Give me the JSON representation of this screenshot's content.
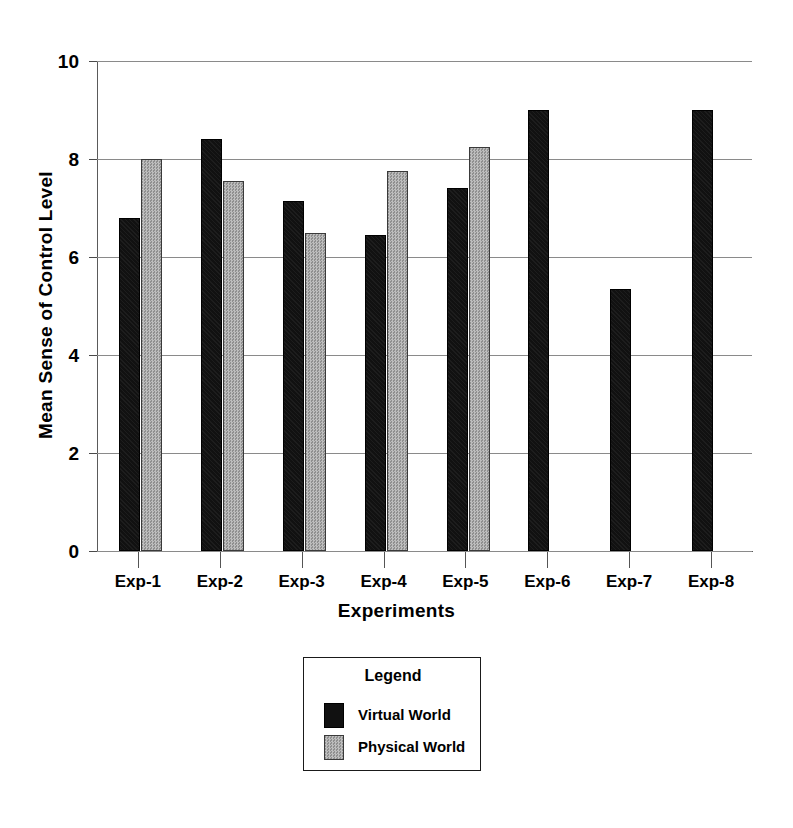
{
  "chart_data": {
    "type": "bar",
    "title": "",
    "xlabel": "Experiments",
    "ylabel": "Mean Sense of Control Level",
    "categories": [
      "Exp-1",
      "Exp-2",
      "Exp-3",
      "Exp-4",
      "Exp-5",
      "Exp-6",
      "Exp-7",
      "Exp-8"
    ],
    "series": [
      {
        "name": "Virtual World",
        "color": "#111111",
        "values": [
          6.8,
          8.4,
          7.15,
          6.45,
          7.4,
          9.0,
          5.35,
          9.0
        ]
      },
      {
        "name": "Physical World",
        "color": "#a8a8a8",
        "values": [
          8.0,
          7.55,
          6.5,
          7.75,
          8.25,
          null,
          null,
          null
        ]
      }
    ],
    "ylim": [
      0,
      10
    ],
    "yticks": [
      0,
      2,
      4,
      6,
      8,
      10
    ],
    "ytick_labels": [
      "0",
      "2",
      "4",
      "6",
      "8",
      "10"
    ],
    "grid": "horizontal",
    "legend_position": "below-plot-center"
  },
  "legend": {
    "title": "Legend",
    "entries": [
      {
        "label": "Virtual World",
        "swatch": "black-square-swatch"
      },
      {
        "label": "Physical World",
        "swatch": "gray-square-swatch"
      }
    ]
  }
}
